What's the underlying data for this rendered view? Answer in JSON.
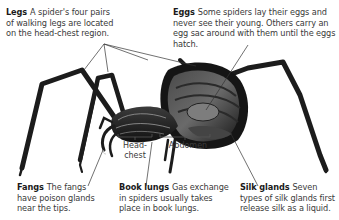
{
  "callouts": {
    "legs": {
      "title": "Legs",
      "text": "A spider's four pairs of walking legs are located on the head-chest region."
    },
    "eggs": {
      "title": "Eggs",
      "text": "Some spiders lay their eggs and never see their young. Others carry an egg sac around with them until the eggs hatch."
    },
    "fangs": {
      "title": "Fangs",
      "text": "The fangs have poison glands near the tips."
    },
    "book_lungs": {
      "title": "Book lungs",
      "text": "Gas exchange in spiders usually takes place in book lungs."
    },
    "silk_glands": {
      "title": "Silk glands",
      "text": "Seven types of silk glands first release silk as a liquid."
    }
  },
  "body_labels": {
    "head_chest": "Head-\nchest",
    "head_chest_line1": "Head-",
    "head_chest_line2": "chest",
    "abdomen": "Abdomen"
  },
  "colors": {
    "spider_body": "#1c1c1c",
    "spider_highlight": "#8a8a8a",
    "leader_line": "#333333",
    "text": "#3a3a3a"
  }
}
